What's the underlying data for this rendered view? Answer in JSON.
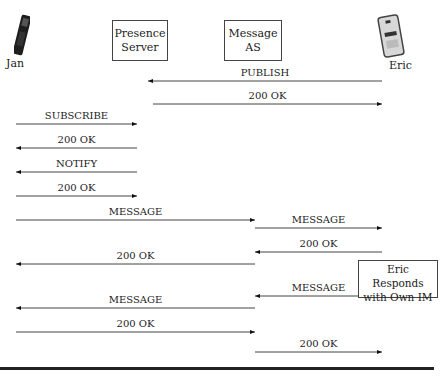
{
  "actors": [
    {
      "id": "jan",
      "label": "Jan",
      "type": "phone"
    },
    {
      "id": "presence",
      "label_lines": [
        "Presence",
        "Server"
      ],
      "type": "server"
    },
    {
      "id": "message_as",
      "label_lines": [
        "Message",
        "AS"
      ],
      "type": "server"
    },
    {
      "id": "eric",
      "label": "Eric",
      "type": "phone"
    }
  ],
  "messages": [
    {
      "label": "PUBLISH",
      "from": "eric",
      "to": "presence",
      "y": 81,
      "x1": 382,
      "x2": 148
    },
    {
      "label": "200 OK",
      "from": "presence",
      "to": "eric",
      "y": 104,
      "x1": 153,
      "x2": 382
    },
    {
      "label": "SUBSCRIBE",
      "from": "jan",
      "to": "presence",
      "y": 124,
      "x1": 16,
      "x2": 137
    },
    {
      "label": "200 OK",
      "from": "presence",
      "to": "jan",
      "y": 148,
      "x1": 137,
      "x2": 16
    },
    {
      "label": "NOTIFY",
      "from": "presence",
      "to": "jan",
      "y": 172,
      "x1": 137,
      "x2": 16
    },
    {
      "label": "200 OK",
      "from": "jan",
      "to": "presence",
      "y": 196,
      "x1": 16,
      "x2": 137
    },
    {
      "label": "MESSAGE",
      "from": "jan",
      "to": "message_as",
      "y": 220,
      "x1": 16,
      "x2": 255
    },
    {
      "label": "MESSAGE",
      "from": "message_as",
      "to": "eric",
      "y": 228,
      "x1": 255,
      "x2": 382
    },
    {
      "label": "200 OK",
      "from": "eric",
      "to": "message_as",
      "y": 252,
      "x1": 382,
      "x2": 255
    },
    {
      "label": "200 OK",
      "from": "message_as",
      "to": "jan",
      "y": 264,
      "x1": 255,
      "x2": 16
    },
    {
      "label": "MESSAGE",
      "from": "eric",
      "to": "message_as",
      "y": 296,
      "x1": 382,
      "x2": 255
    },
    {
      "label": "MESSAGE",
      "from": "message_as",
      "to": "jan",
      "y": 308,
      "x1": 255,
      "x2": 16
    },
    {
      "label": "200 OK",
      "from": "jan",
      "to": "message_as",
      "y": 332,
      "x1": 16,
      "x2": 255
    },
    {
      "label": "200 OK",
      "from": "message_as",
      "to": "eric",
      "y": 352,
      "x1": 255,
      "x2": 382
    }
  ],
  "note": {
    "lines": [
      "Eric Responds",
      "with Own IM"
    ]
  },
  "colors": {
    "line": "#444444",
    "rule": "#222222"
  }
}
